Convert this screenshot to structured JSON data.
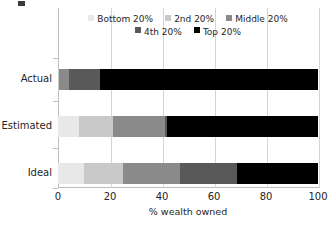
{
  "chart_data": {
    "type": "bar",
    "orientation": "horizontal",
    "stacked": true,
    "stack_mode": "percent",
    "title": "",
    "xlabel": "% wealth owned",
    "ylabel": "",
    "xlim": [
      0,
      100
    ],
    "xticks": [
      0,
      20,
      40,
      60,
      80,
      100
    ],
    "grid": true,
    "grid_axis": "x",
    "legend_position": "top",
    "categories": [
      "Actual",
      "Estimated",
      "Ideal"
    ],
    "series": [
      {
        "name": "Bottom 20%",
        "color": "#e8e8e8",
        "values": [
          0.1,
          8.0,
          10.0
        ]
      },
      {
        "name": "2nd 20%",
        "color": "#c9c9c9",
        "values": [
          0.2,
          13.0,
          15.0
        ]
      },
      {
        "name": "Middle 20%",
        "color": "#8a8a8a",
        "values": [
          4.0,
          20.0,
          22.0
        ]
      },
      {
        "name": "4th 20%",
        "color": "#595959",
        "values": [
          11.7,
          1.0,
          22.0
        ]
      },
      {
        "name": "Top 20%",
        "color": "#000000",
        "values": [
          84.0,
          58.0,
          31.0
        ]
      }
    ]
  },
  "legend": {
    "rows": [
      [
        {
          "label": "Bottom 20%",
          "color": "#e8e8e8"
        },
        {
          "label": "2nd 20%",
          "color": "#c9c9c9"
        },
        {
          "label": "Middle 20%",
          "color": "#8a8a8a"
        }
      ],
      [
        {
          "label": "4th 20%",
          "color": "#595959"
        },
        {
          "label": "Top 20%",
          "color": "#000000"
        }
      ]
    ]
  },
  "axis": {
    "x_tick_labels": [
      "0",
      "20",
      "40",
      "60",
      "80",
      "100"
    ],
    "x_title": "% wealth owned",
    "y_tick_labels": [
      "Actual",
      "Estimated",
      "Ideal"
    ]
  }
}
